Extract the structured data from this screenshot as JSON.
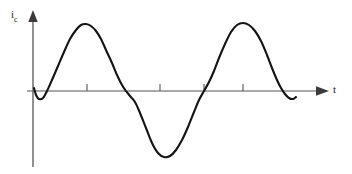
{
  "figure": {
    "kind": "waveform-plot",
    "background_color": "#ffffff",
    "line_color": "#141414",
    "axis_color": "#4a4a4a",
    "y_axis": {
      "label_symbol": "i",
      "label_subscript": "c",
      "label_full": "ic",
      "arrow": "up-arrow-icon",
      "x": 33,
      "top": 12,
      "bottom": 167
    },
    "x_axis": {
      "label": "t",
      "arrow": "right-arrow-icon",
      "y": 91,
      "left": 27,
      "right": 320
    },
    "ticks": {
      "direction": "up",
      "length": 7,
      "positions": [
        87,
        160,
        204,
        243
      ]
    }
  },
  "chart_data": {
    "type": "line",
    "title": "",
    "xlabel": "t",
    "ylabel": "ic",
    "grid": false,
    "legend": null,
    "axis_arrows": true,
    "xlim": [
      0,
      320
    ],
    "ylim": [
      -80,
      80
    ],
    "tick_positions_px": [
      87,
      160,
      204,
      243
    ],
    "series": [
      {
        "name": "ic",
        "description": "Capacitor current: distorted two-cycle sinusoid, starting slightly negative, rising to a positive peak, falling to a negative trough, rising to a second positive peak, then ending slightly negative.",
        "points_px": [
          [
            34,
            88
          ],
          [
            36,
            95
          ],
          [
            39,
            99
          ],
          [
            43,
            98
          ],
          [
            47,
            91
          ],
          [
            52,
            80
          ],
          [
            58,
            66
          ],
          [
            64,
            52
          ],
          [
            70,
            39
          ],
          [
            76,
            30
          ],
          [
            81,
            25
          ],
          [
            86,
            24
          ],
          [
            91,
            26
          ],
          [
            96,
            31
          ],
          [
            101,
            39
          ],
          [
            106,
            50
          ],
          [
            112,
            63
          ],
          [
            117,
            75
          ],
          [
            122,
            85
          ],
          [
            126,
            91
          ],
          [
            130,
            96
          ],
          [
            135,
            102
          ],
          [
            140,
            113
          ],
          [
            146,
            128
          ],
          [
            152,
            143
          ],
          [
            158,
            153
          ],
          [
            164,
            157
          ],
          [
            170,
            156
          ],
          [
            176,
            150
          ],
          [
            182,
            140
          ],
          [
            188,
            127
          ],
          [
            194,
            112
          ],
          [
            199,
            100
          ],
          [
            204,
            91
          ],
          [
            209,
            82
          ],
          [
            214,
            71
          ],
          [
            219,
            58
          ],
          [
            225,
            44
          ],
          [
            231,
            32
          ],
          [
            237,
            25
          ],
          [
            243,
            23
          ],
          [
            249,
            25
          ],
          [
            255,
            31
          ],
          [
            261,
            41
          ],
          [
            267,
            55
          ],
          [
            272,
            68
          ],
          [
            277,
            80
          ],
          [
            281,
            88
          ],
          [
            285,
            94
          ],
          [
            289,
            98
          ],
          [
            293,
            99
          ],
          [
            296,
            97
          ]
        ],
        "key_features": {
          "start": [
            34,
            88
          ],
          "first_zero_crossing_up": 43,
          "first_peak": [
            86,
            24
          ],
          "second_zero_crossing_down": 127,
          "trough": [
            164,
            157
          ],
          "third_zero_crossing_up": 204,
          "second_peak": [
            243,
            23
          ],
          "fourth_zero_crossing_down": 283,
          "end": [
            296,
            97
          ]
        }
      }
    ]
  }
}
